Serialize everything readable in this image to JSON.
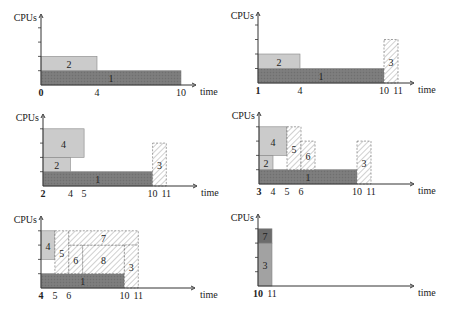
{
  "chart_data": {
    "type": "gantt-schedule",
    "title": "",
    "panel_count": 6,
    "ylabel": "CPUs",
    "xlabel": "time",
    "y_ticks": 4,
    "styles": {
      "dark": {
        "fill": "#7b7b7b",
        "pattern": "crosshatch"
      },
      "light": {
        "fill": "#cbcbcb",
        "pattern": "none"
      },
      "hatch": {
        "fill": "#ffffff",
        "pattern": "diagonal"
      },
      "mid": {
        "fill": "#a2a2a2",
        "pattern": "none"
      },
      "darker": {
        "fill": "#6c6c6c",
        "pattern": "none"
      }
    },
    "panels": [
      {
        "id": 1,
        "origin": [
          41,
          85
        ],
        "unit_x": 14,
        "unit_y": 14.3,
        "axis_top": 14,
        "axis_right": 196,
        "time_start": 0,
        "current_time_label": "0",
        "x_tick_labels": [
          "0",
          "4",
          "10"
        ],
        "x_tick_values": [
          0,
          4,
          10
        ],
        "time_label_x": 200,
        "jobs": [
          {
            "label": "1",
            "t0": 0,
            "t1": 10,
            "c0": 0,
            "c1": 1,
            "style": "dark"
          },
          {
            "label": "2",
            "t0": 0,
            "t1": 4,
            "c0": 1,
            "c1": 2,
            "style": "light"
          }
        ]
      },
      {
        "id": 2,
        "origin": [
          258,
          83
        ],
        "unit_x": 14,
        "unit_y": 14.5,
        "axis_top": 12,
        "axis_right": 414,
        "time_start": 1,
        "current_time_label": "1",
        "x_tick_labels": [
          "1",
          "4",
          "10",
          "11"
        ],
        "x_tick_values": [
          1,
          4,
          10,
          11
        ],
        "time_label_x": 418,
        "jobs": [
          {
            "label": "1",
            "t0": 1,
            "t1": 10,
            "c0": 0,
            "c1": 1,
            "style": "dark"
          },
          {
            "label": "2",
            "t0": 1,
            "t1": 4,
            "c0": 1,
            "c1": 2,
            "style": "light"
          },
          {
            "label": "3",
            "t0": 10,
            "t1": 11,
            "c0": 0,
            "c1": 3,
            "style": "hatch"
          }
        ]
      },
      {
        "id": 3,
        "origin": [
          43,
          186
        ],
        "unit_x": 13.7,
        "unit_y": 14.3,
        "axis_top": 114,
        "axis_right": 197,
        "time_start": 2,
        "current_time_label": "2",
        "x_tick_labels": [
          "2",
          "4",
          "5",
          "10",
          "11"
        ],
        "x_tick_values": [
          2,
          4,
          5,
          10,
          11
        ],
        "time_label_x": 201,
        "jobs": [
          {
            "label": "1",
            "t0": 2,
            "t1": 10,
            "c0": 0,
            "c1": 1,
            "style": "dark"
          },
          {
            "label": "2",
            "t0": 2,
            "t1": 4,
            "c0": 1,
            "c1": 2,
            "style": "light"
          },
          {
            "label": "4",
            "t0": 2,
            "t1": 5,
            "c0": 2,
            "c1": 4,
            "style": "light"
          },
          {
            "label": "3",
            "t0": 10,
            "t1": 11,
            "c0": 0,
            "c1": 3,
            "style": "hatch"
          }
        ]
      },
      {
        "id": 4,
        "origin": [
          259,
          184
        ],
        "unit_x": 14,
        "unit_y": 14.3,
        "axis_top": 112,
        "axis_right": 414,
        "time_start": 3,
        "current_time_label": "3",
        "x_tick_labels": [
          "3",
          "4",
          "5",
          "6",
          "10",
          "11"
        ],
        "x_tick_values": [
          3,
          4,
          5,
          6,
          10,
          11
        ],
        "time_label_x": 418,
        "jobs": [
          {
            "label": "1",
            "t0": 3,
            "t1": 10,
            "c0": 0,
            "c1": 1,
            "style": "dark"
          },
          {
            "label": "2",
            "t0": 3,
            "t1": 4,
            "c0": 1,
            "c1": 2,
            "style": "light"
          },
          {
            "label": "4",
            "t0": 3,
            "t1": 5,
            "c0": 2,
            "c1": 4,
            "style": "light"
          },
          {
            "label": "5",
            "t0": 5,
            "t1": 6,
            "c0": 1,
            "c1": 4,
            "style": "hatch"
          },
          {
            "label": "6",
            "t0": 6,
            "t1": 7,
            "c0": 1,
            "c1": 3,
            "style": "hatch"
          },
          {
            "label": "3",
            "t0": 10,
            "t1": 11,
            "c0": 1,
            "c1": 3,
            "style": "hatch",
            "extend_to_base": true
          }
        ]
      },
      {
        "id": 5,
        "origin": [
          41,
          288
        ],
        "unit_x": 13.9,
        "unit_y": 14.3,
        "axis_top": 216,
        "axis_right": 195,
        "time_start": 4,
        "current_time_label": "4",
        "x_tick_labels": [
          "4",
          "5",
          "6",
          "10",
          "11"
        ],
        "x_tick_values": [
          4,
          5,
          6,
          10,
          11
        ],
        "time_label_x": 200,
        "jobs": [
          {
            "label": "1",
            "t0": 4,
            "t1": 10,
            "c0": 0,
            "c1": 1,
            "style": "dark"
          },
          {
            "label": "4",
            "t0": 4,
            "t1": 5,
            "c0": 2,
            "c1": 4,
            "style": "light"
          },
          {
            "label": "5",
            "t0": 5,
            "t1": 6,
            "c0": 1,
            "c1": 4,
            "style": "hatch"
          },
          {
            "label": "6",
            "t0": 6,
            "t1": 7,
            "c0": 1,
            "c1": 3,
            "style": "hatch"
          },
          {
            "label": "8",
            "t0": 7,
            "t1": 10,
            "c0": 1,
            "c1": 3,
            "style": "hatch"
          },
          {
            "label": "7",
            "t0": 6,
            "t1": 11,
            "c0": 3,
            "c1": 4,
            "style": "hatch"
          },
          {
            "label": "3",
            "t0": 10,
            "t1": 11,
            "c0": 0,
            "c1": 3,
            "style": "hatch"
          }
        ]
      },
      {
        "id": 6,
        "origin": [
          258,
          286
        ],
        "unit_x": 14,
        "unit_y": 14.3,
        "axis_top": 214,
        "axis_right": 414,
        "time_start": 10,
        "current_time_label": "10",
        "x_tick_labels": [
          "10",
          "11"
        ],
        "x_tick_values": [
          10,
          11
        ],
        "time_label_x": 418,
        "jobs": [
          {
            "label": "3",
            "t0": 10,
            "t1": 11,
            "c0": 0,
            "c1": 3,
            "style": "mid"
          },
          {
            "label": "7",
            "t0": 10,
            "t1": 11,
            "c0": 3,
            "c1": 4,
            "style": "darker"
          }
        ]
      }
    ]
  }
}
